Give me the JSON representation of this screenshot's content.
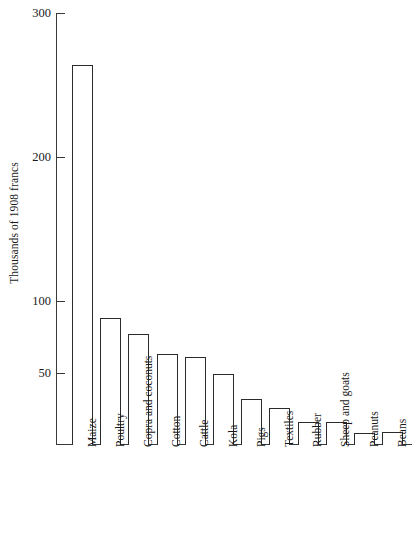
{
  "chart_data": {
    "type": "bar",
    "title": "",
    "subtitle": "",
    "xlabel": "",
    "ylabel": "Thousands of 1908 francs",
    "categories": [
      "Maize",
      "Poultry",
      "Copra and coconuts",
      "Cotton",
      "Cattle",
      "Kola",
      "Pigs",
      "Textiles",
      "Rubber",
      "Sheep and goats",
      "Peanuts",
      "Beans"
    ],
    "values": [
      264,
      88,
      77,
      63,
      61,
      49,
      32,
      26,
      16,
      16,
      8,
      9
    ],
    "ylim": [
      0,
      300
    ],
    "yticks": [
      50,
      100,
      200,
      300
    ],
    "ytick_labels": [
      "50",
      "100",
      "200",
      "300"
    ],
    "grid": false,
    "legend": false,
    "legend_position": "none",
    "bar_fill_color": "#ffffff",
    "bar_edge_color": "#2b2b2b",
    "axis_color": "#3a3a3a",
    "text_color": "#1a1a1a",
    "background_color": "#ffffff"
  }
}
